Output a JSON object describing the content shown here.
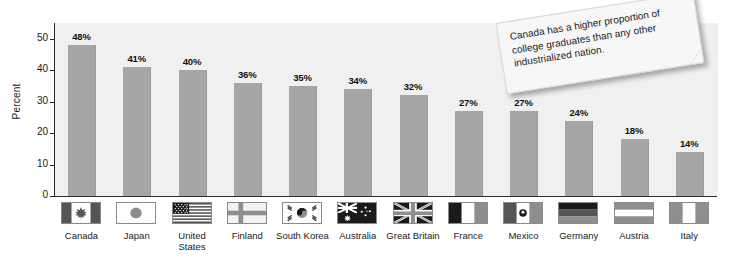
{
  "chart_data": {
    "type": "bar",
    "title": "",
    "xlabel": "",
    "ylabel": "Percent",
    "ylim": [
      0,
      55
    ],
    "yticks": [
      0,
      10,
      20,
      30,
      40,
      50
    ],
    "grid": false,
    "legend": "none",
    "categories": [
      "Canada",
      "Japan",
      "United States",
      "Finland",
      "South Korea",
      "Australia",
      "Great Britain",
      "France",
      "Mexico",
      "Germany",
      "Austria",
      "Italy"
    ],
    "values": [
      48,
      41,
      40,
      36,
      35,
      34,
      32,
      27,
      27,
      24,
      18,
      14
    ],
    "value_labels": [
      "48%",
      "41%",
      "40%",
      "36%",
      "35%",
      "34%",
      "32%",
      "27%",
      "27%",
      "24%",
      "18%",
      "14%"
    ],
    "annotations": [
      "Canada has a higher proportion of college graduates than any other industrialized nation."
    ],
    "bar_color": "#a6a6a6",
    "plot_background": "#f0f0f0"
  },
  "axis": {
    "y_title": "Percent",
    "y_ticks": [
      "0",
      "10",
      "20",
      "30",
      "40",
      "50"
    ]
  },
  "bars": [
    {
      "country": "Canada",
      "label": "48%",
      "value": 48,
      "flag": "flag-canada"
    },
    {
      "country": "Japan",
      "label": "41%",
      "value": 41,
      "flag": "flag-japan"
    },
    {
      "country": "United States",
      "label": "40%",
      "value": 40,
      "flag": "flag-united-states"
    },
    {
      "country": "Finland",
      "label": "36%",
      "value": 36,
      "flag": "flag-finland"
    },
    {
      "country": "South Korea",
      "label": "35%",
      "value": 35,
      "flag": "flag-south-korea"
    },
    {
      "country": "Australia",
      "label": "34%",
      "value": 34,
      "flag": "flag-australia"
    },
    {
      "country": "Great Britain",
      "label": "32%",
      "value": 32,
      "flag": "flag-great-britain"
    },
    {
      "country": "France",
      "label": "27%",
      "value": 27,
      "flag": "flag-france"
    },
    {
      "country": "Mexico",
      "label": "27%",
      "value": 27,
      "flag": "flag-mexico"
    },
    {
      "country": "Germany",
      "label": "24%",
      "value": 24,
      "flag": "flag-germany"
    },
    {
      "country": "Austria",
      "label": "18%",
      "value": 18,
      "flag": "flag-austria"
    },
    {
      "country": "Italy",
      "label": "14%",
      "value": 14,
      "flag": "flag-italy"
    }
  ],
  "note": {
    "text": "Canada has a higher proportion of college graduates than any other industrialized nation."
  },
  "colors": {
    "bar": "#a6a6a6",
    "plot_background": "#f0f0f0",
    "axis": "#2b2b2b",
    "text": "#1a1a1a",
    "note_background": "#f7f7f7"
  }
}
